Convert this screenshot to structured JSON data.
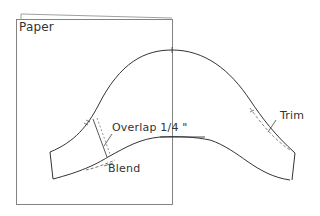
{
  "diagram": {
    "type": "pattern-piece-illustration",
    "labels": {
      "paper": "Paper",
      "overlap": "Overlap 1/4 \"",
      "blend": "Blend",
      "trim": "Trim"
    },
    "colors": {
      "line": "#333333",
      "paper_edge": "#777777",
      "background": "#ffffff"
    }
  }
}
